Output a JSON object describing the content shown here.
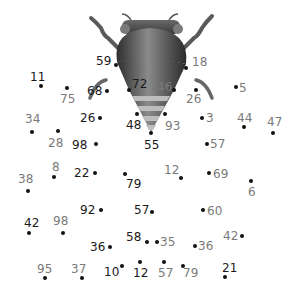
{
  "puzzle": {
    "type": "connect-the-dots",
    "subject": "bee-illustration",
    "colors": {
      "dot": "#111111",
      "label_dark": "#1a1a1a",
      "label_gray": "#7a7a7a",
      "bee_body": "#555555",
      "bee_stripe_light": "#bdbdbd"
    },
    "points": [
      {
        "n": "59",
        "x": 116,
        "y": 65,
        "lx": 96,
        "ly": 55,
        "tone": "dark"
      },
      {
        "n": "18",
        "x": 186,
        "y": 68,
        "lx": 192,
        "ly": 56,
        "tone": "gray"
      },
      {
        "n": "11",
        "x": 41,
        "y": 86,
        "lx": 30,
        "ly": 71,
        "tone": "dark"
      },
      {
        "n": "75",
        "x": 67,
        "y": 88,
        "lx": 60,
        "ly": 93,
        "tone": "gray"
      },
      {
        "n": "68",
        "x": 107,
        "y": 91,
        "lx": 87,
        "ly": 85,
        "tone": "dark"
      },
      {
        "n": "72",
        "x": 129,
        "y": 90,
        "lx": 132,
        "ly": 78,
        "tone": "dark"
      },
      {
        "n": "46",
        "x": 174,
        "y": 90,
        "lx": 157,
        "ly": 81,
        "tone": "gray"
      },
      {
        "n": "26",
        "x": 196,
        "y": 90,
        "lx": 186,
        "ly": 93,
        "tone": "gray"
      },
      {
        "n": "5",
        "x": 236,
        "y": 87,
        "lx": 239,
        "ly": 82,
        "tone": "gray"
      },
      {
        "n": "34",
        "x": 32,
        "y": 132,
        "lx": 25,
        "ly": 113,
        "tone": "gray"
      },
      {
        "n": "28",
        "x": 58,
        "y": 131,
        "lx": 48,
        "ly": 137,
        "tone": "gray"
      },
      {
        "n": "26",
        "x": 100,
        "y": 118,
        "lx": 80,
        "ly": 112,
        "tone": "dark"
      },
      {
        "n": "48",
        "x": 137,
        "y": 114,
        "lx": 126,
        "ly": 119,
        "tone": "dark"
      },
      {
        "n": "93",
        "x": 165,
        "y": 114,
        "lx": 165,
        "ly": 120,
        "tone": "gray"
      },
      {
        "n": "3",
        "x": 202,
        "y": 118,
        "lx": 206,
        "ly": 112,
        "tone": "gray"
      },
      {
        "n": "44",
        "x": 244,
        "y": 127,
        "lx": 237,
        "ly": 112,
        "tone": "gray"
      },
      {
        "n": "47",
        "x": 273,
        "y": 133,
        "lx": 267,
        "ly": 116,
        "tone": "gray"
      },
      {
        "n": "98",
        "x": 96,
        "y": 144,
        "lx": 72,
        "ly": 139,
        "tone": "dark"
      },
      {
        "n": "55",
        "x": 151,
        "y": 133,
        "lx": 144,
        "ly": 139,
        "tone": "dark"
      },
      {
        "n": "57",
        "x": 207,
        "y": 144,
        "lx": 210,
        "ly": 138,
        "tone": "gray"
      },
      {
        "n": "8",
        "x": 54,
        "y": 177,
        "lx": 52,
        "ly": 161,
        "tone": "gray"
      },
      {
        "n": "22",
        "x": 95,
        "y": 173,
        "lx": 74,
        "ly": 167,
        "tone": "dark"
      },
      {
        "n": "12",
        "x": 181,
        "y": 178,
        "lx": 164,
        "ly": 164,
        "tone": "gray"
      },
      {
        "n": "69",
        "x": 209,
        "y": 173,
        "lx": 213,
        "ly": 168,
        "tone": "gray"
      },
      {
        "n": "79",
        "x": 125,
        "y": 174,
        "lx": 126,
        "ly": 178,
        "tone": "dark"
      },
      {
        "n": "38",
        "x": 28,
        "y": 191,
        "lx": 18,
        "ly": 173,
        "tone": "gray"
      },
      {
        "n": "6",
        "x": 251,
        "y": 181,
        "lx": 248,
        "ly": 186,
        "tone": "gray"
      },
      {
        "n": "92",
        "x": 101,
        "y": 210,
        "lx": 80,
        "ly": 204,
        "tone": "dark"
      },
      {
        "n": "57",
        "x": 152,
        "y": 212,
        "lx": 134,
        "ly": 204,
        "tone": "dark"
      },
      {
        "n": "60",
        "x": 203,
        "y": 210,
        "lx": 207,
        "ly": 205,
        "tone": "gray"
      },
      {
        "n": "42",
        "x": 29,
        "y": 233,
        "lx": 24,
        "ly": 217,
        "tone": "dark"
      },
      {
        "n": "98",
        "x": 63,
        "y": 233,
        "lx": 53,
        "ly": 215,
        "tone": "gray"
      },
      {
        "n": "42",
        "x": 242,
        "y": 236,
        "lx": 223,
        "ly": 230,
        "tone": "gray"
      },
      {
        "n": "58",
        "x": 147,
        "y": 242,
        "lx": 126,
        "ly": 231,
        "tone": "dark"
      },
      {
        "n": "35",
        "x": 157,
        "y": 242,
        "lx": 160,
        "ly": 236,
        "tone": "gray"
      },
      {
        "n": "36",
        "x": 110,
        "y": 247,
        "lx": 90,
        "ly": 241,
        "tone": "dark"
      },
      {
        "n": "36",
        "x": 195,
        "y": 246,
        "lx": 198,
        "ly": 240,
        "tone": "gray"
      },
      {
        "n": "95",
        "x": 45,
        "y": 278,
        "lx": 37,
        "ly": 263,
        "tone": "gray"
      },
      {
        "n": "37",
        "x": 82,
        "y": 278,
        "lx": 71,
        "ly": 263,
        "tone": "gray"
      },
      {
        "n": "10",
        "x": 122,
        "y": 266,
        "lx": 104,
        "ly": 266,
        "tone": "dark"
      },
      {
        "n": "12",
        "x": 140,
        "y": 262,
        "lx": 133,
        "ly": 267,
        "tone": "dark"
      },
      {
        "n": "57",
        "x": 164,
        "y": 262,
        "lx": 158,
        "ly": 267,
        "tone": "gray"
      },
      {
        "n": "79",
        "x": 183,
        "y": 266,
        "lx": 183,
        "ly": 267,
        "tone": "gray"
      },
      {
        "n": "21",
        "x": 225,
        "y": 277,
        "lx": 222,
        "ly": 262,
        "tone": "dark"
      }
    ]
  }
}
